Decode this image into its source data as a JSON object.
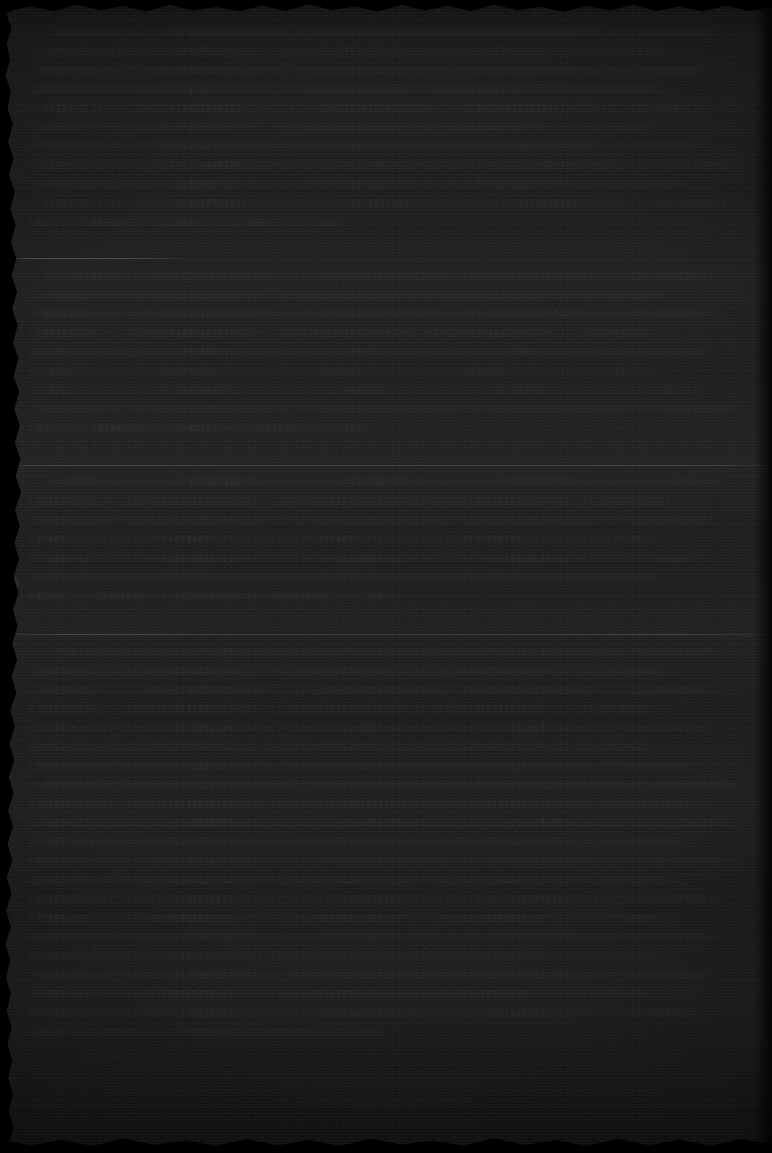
{
  "document": {
    "kind": "scanned-page",
    "legibility": "illegible",
    "exposure": "severely-underexposed",
    "visible_text": "",
    "note_no_readable_text": "No glyphs are resolvable at any zoom level; only faint horizontal text bands are visible.",
    "dimensions": {
      "width_px": 772,
      "height_px": 1153
    },
    "colors": {
      "frame": "#000000",
      "paper_darkest": "#131313",
      "paper_base": "#1e1e1e",
      "paper_lightest": "#232323",
      "rule_tint": "#ffffff"
    },
    "edges": {
      "left": "torn-ragged",
      "top": "scalloped",
      "bottom": "scalloped",
      "right": "flush-to-frame"
    },
    "text_blocks": [
      {
        "name": "block-upper",
        "top": 28,
        "left": 26,
        "width": 724,
        "lines": 11,
        "indent_first": 18
      },
      {
        "name": "block-mid",
        "top": 272,
        "left": 26,
        "width": 722,
        "lines": 9,
        "indent_first": 16
      },
      {
        "name": "block-lower",
        "top": 478,
        "left": 24,
        "width": 726,
        "lines": 7,
        "indent_first": 20
      },
      {
        "name": "block-tail",
        "top": 648,
        "left": 24,
        "width": 728,
        "lines": 21,
        "indent_first": 18
      }
    ],
    "rules": [
      {
        "name": "section-rule-short",
        "top": 258,
        "left": 10,
        "width": 172,
        "style": "short"
      },
      {
        "name": "section-rule-mid",
        "top": 465,
        "left": 0,
        "width": 772,
        "style": "full"
      },
      {
        "name": "section-rule-main",
        "top": 634,
        "left": 0,
        "width": 772,
        "style": "full"
      }
    ],
    "marks": [
      {
        "name": "margin-ink-mark",
        "top": 578,
        "left": 4,
        "width": 16,
        "height": 14
      }
    ]
  }
}
